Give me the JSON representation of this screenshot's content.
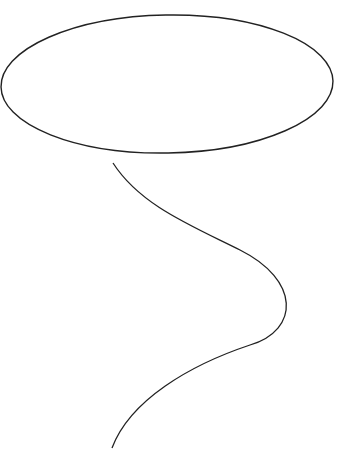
{
  "drawing": {
    "description": "Hand-drawn balloon: ellipse with a wavy string",
    "stroke_color": "#222222",
    "background": "#ffffff",
    "shapes": [
      {
        "type": "ellipse",
        "name": "balloon",
        "cx": 167,
        "cy": 85,
        "rx": 167,
        "ry": 69
      },
      {
        "type": "path",
        "name": "string",
        "points": [
          [
            113,
            163
          ],
          [
            150,
            205
          ],
          [
            232,
            247
          ],
          [
            292,
            300
          ],
          [
            232,
            360
          ],
          [
            150,
            400
          ],
          [
            112,
            448
          ]
        ]
      }
    ]
  }
}
